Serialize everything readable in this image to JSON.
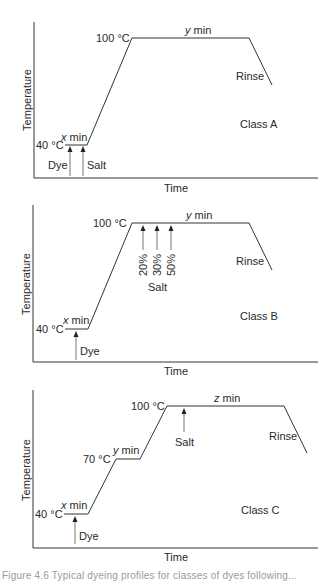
{
  "panels": [
    {
      "id": "A",
      "class_label": "Class A",
      "y_axis_label": "Temperature",
      "x_axis_label": "Time",
      "temp_low": "40 °C",
      "temp_high": "100 °C",
      "hold_low": "x min",
      "hold_high": "y min",
      "rinse": "Rinse",
      "arrows": [
        "Dye",
        "Salt"
      ]
    },
    {
      "id": "B",
      "class_label": "Class B",
      "y_axis_label": "Temperature",
      "x_axis_label": "Time",
      "temp_low": "40 °C",
      "temp_high": "100 °C",
      "hold_low": "x min",
      "hold_high": "y min",
      "rinse": "Rinse",
      "dye": "Dye",
      "salt": "Salt",
      "salt_additions": [
        "20%",
        "30%",
        "50%"
      ]
    },
    {
      "id": "C",
      "class_label": "Class C",
      "y_axis_label": "Temperature",
      "x_axis_label": "Time",
      "temp_low": "40 °C",
      "temp_mid": "70 °C",
      "temp_high": "100 °C",
      "hold_low": "x min",
      "hold_mid": "y min",
      "hold_high": "z min",
      "rinse": "Rinse",
      "dye": "Dye",
      "salt": "Salt"
    }
  ],
  "caption": "Figure 4.6  Typical dyeing profiles for classes of dyes following..."
}
